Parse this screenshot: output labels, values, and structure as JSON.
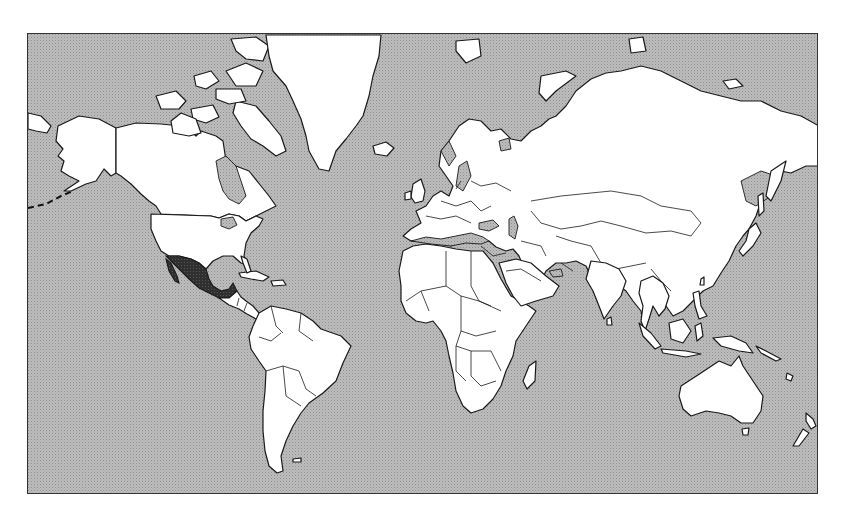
{
  "map": {
    "type": "world-political-outline",
    "projection": "mercator",
    "highlighted_country": "Mexico",
    "colors": {
      "ocean": "#b9b9b9",
      "ocean_dot": "#9a9a9a",
      "land": "#ffffff",
      "outline": "#1a1a1a",
      "highlight": "#2e2e2e"
    },
    "regions": [
      "North America",
      "Greenland",
      "Mexico",
      "Central America",
      "Caribbean",
      "South America",
      "Europe",
      "Africa",
      "Middle East",
      "Russia",
      "Asia",
      "Indonesia",
      "Australia",
      "New Zealand",
      "Japan",
      "Madagascar",
      "Iceland"
    ]
  }
}
